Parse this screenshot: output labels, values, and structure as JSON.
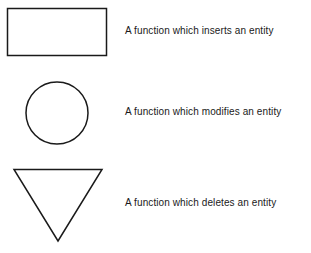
{
  "legend": [
    {
      "shape": "rectangle",
      "label": "A function which inserts an entity"
    },
    {
      "shape": "circle",
      "label": "A function which modifies an entity"
    },
    {
      "shape": "inverted-triangle",
      "label": "A function which deletes an entity"
    }
  ],
  "colors": {
    "stroke": "#1a1a1a",
    "background": "#ffffff"
  }
}
